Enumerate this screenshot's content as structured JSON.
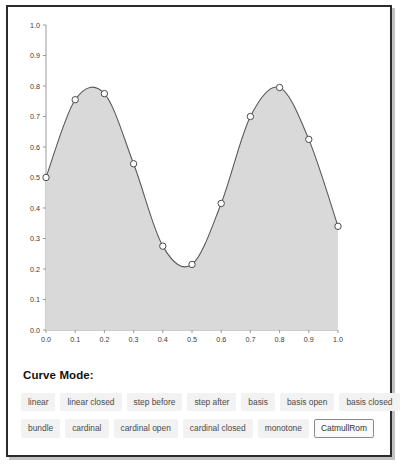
{
  "panel": {
    "controls_label": "Curve Mode:"
  },
  "chart_data": {
    "type": "area",
    "title": "",
    "xlabel": "",
    "ylabel": "",
    "xlim": [
      0,
      1
    ],
    "ylim": [
      0,
      1
    ],
    "grid": false,
    "legend": "none",
    "curve_interpolation": "CatmullRom",
    "x_ticks": [
      "0.0",
      "0.1",
      "0.2",
      "0.3",
      "0.4",
      "0.5",
      "0.6",
      "0.7",
      "0.8",
      "0.9",
      "1.0"
    ],
    "y_ticks": [
      "0.0",
      "0.1",
      "0.2",
      "0.3",
      "0.4",
      "0.5",
      "0.6",
      "0.7",
      "0.8",
      "0.9",
      "1.0"
    ],
    "x": [
      0.0,
      0.1,
      0.2,
      0.3,
      0.4,
      0.5,
      0.6,
      0.7,
      0.8,
      0.9,
      1.0
    ],
    "values": [
      0.5,
      0.755,
      0.775,
      0.545,
      0.275,
      0.215,
      0.415,
      0.7,
      0.795,
      0.625,
      0.34
    ],
    "series": [
      {
        "name": "curve",
        "values": [
          0.5,
          0.755,
          0.775,
          0.545,
          0.275,
          0.215,
          0.415,
          0.7,
          0.795,
          0.625,
          0.34
        ]
      }
    ],
    "colors": {
      "area_fill": "#d9d9d9",
      "line": "#5a5a5a",
      "point_fill": "#ffffff",
      "point_stroke": "#4a4a4a",
      "axis": "#9a9a9a"
    }
  },
  "curve_modes": {
    "selected": "CatmullRom",
    "row1": [
      {
        "label": "linear"
      },
      {
        "label": "linear closed"
      },
      {
        "label": "step before"
      },
      {
        "label": "step after"
      },
      {
        "label": "basis"
      },
      {
        "label": "basis open"
      },
      {
        "label": "basis closed"
      }
    ],
    "row2": [
      {
        "label": "bundle"
      },
      {
        "label": "cardinal"
      },
      {
        "label": "cardinal open"
      },
      {
        "label": "cardinal closed"
      },
      {
        "label": "monotone"
      },
      {
        "label": "CatmullRom"
      }
    ]
  }
}
